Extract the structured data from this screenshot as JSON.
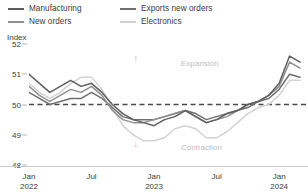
{
  "chart_data": {
    "type": "line",
    "title": "",
    "subtitle": "",
    "xlabel": "",
    "ylabel": "Index",
    "ylim": [
      48,
      52
    ],
    "yticks": [
      48,
      49,
      50,
      51,
      52
    ],
    "grid": false,
    "legend_position": "top-left",
    "reference_line": {
      "value": 50,
      "style": "dashed",
      "color": "#4a4a4a"
    },
    "annotations": [
      {
        "text": "Expansion",
        "icon": "arrow-up-icon",
        "position": "above-reference-line",
        "color": "#bdbdbd"
      },
      {
        "text": "Contraction",
        "icon": "arrow-down-icon",
        "position": "below-reference-line",
        "color": "#bdbdbd"
      }
    ],
    "x_tick_labels": [
      {
        "line1": "Jan",
        "line2": "2022"
      },
      {
        "line1": "Jul",
        "line2": ""
      },
      {
        "line1": "Jan",
        "line2": "2023"
      },
      {
        "line1": "Jul",
        "line2": ""
      },
      {
        "line1": "Jan",
        "line2": "2024"
      }
    ],
    "x": [
      "Jan 2022",
      "Feb 2022",
      "Mar 2022",
      "Apr 2022",
      "May 2022",
      "Jun 2022",
      "Jul 2022",
      "Aug 2022",
      "Sep 2022",
      "Oct 2022",
      "Nov 2022",
      "Dec 2022",
      "Jan 2023",
      "Feb 2023",
      "Mar 2023",
      "Apr 2023",
      "May 2023",
      "Jun 2023",
      "Jul 2023",
      "Aug 2023",
      "Sep 2023",
      "Oct 2023",
      "Nov 2023",
      "Dec 2023",
      "Jan 2024",
      "Feb 2024",
      "Mar 2024"
    ],
    "series": [
      {
        "name": "Manufacturing",
        "color": "#5e5e5e",
        "values": [
          51.0,
          50.7,
          50.4,
          50.6,
          50.8,
          50.6,
          50.7,
          50.4,
          50.0,
          49.7,
          49.5,
          49.4,
          49.3,
          49.5,
          49.6,
          49.8,
          49.6,
          49.4,
          49.5,
          49.7,
          49.8,
          50.0,
          50.1,
          50.3,
          50.7,
          51.6,
          51.4
        ]
      },
      {
        "name": "New orders",
        "color": "#8f8f8f",
        "values": [
          50.6,
          50.3,
          50.1,
          50.3,
          50.5,
          50.4,
          50.6,
          50.3,
          49.8,
          49.5,
          49.4,
          49.4,
          49.5,
          49.6,
          49.7,
          49.8,
          49.6,
          49.4,
          49.5,
          49.6,
          49.8,
          50.0,
          50.1,
          50.3,
          50.6,
          51.4,
          51.2
        ]
      },
      {
        "name": "Exports new orders",
        "color": "#6f6f6f",
        "values": [
          50.4,
          50.2,
          50.0,
          50.1,
          50.2,
          50.2,
          50.4,
          50.2,
          49.9,
          49.6,
          49.5,
          49.5,
          49.5,
          49.6,
          49.7,
          49.8,
          49.7,
          49.5,
          49.6,
          49.7,
          49.8,
          49.9,
          50.1,
          50.2,
          50.5,
          51.0,
          50.9
        ]
      },
      {
        "name": "Electronics",
        "color": "#d2d2d2",
        "values": [
          50.7,
          50.4,
          50.2,
          50.4,
          50.7,
          50.9,
          50.9,
          50.5,
          49.9,
          49.3,
          49.0,
          48.8,
          48.8,
          48.9,
          49.2,
          49.3,
          49.2,
          48.9,
          48.9,
          49.1,
          49.4,
          49.7,
          49.9,
          50.0,
          50.3,
          50.8,
          50.8
        ]
      }
    ]
  },
  "legend": {
    "items": [
      {
        "label": "Manufacturing",
        "color": "#5e5e5e"
      },
      {
        "label": "Exports new orders",
        "color": "#6f6f6f"
      },
      {
        "label": "New orders",
        "color": "#8f8f8f"
      },
      {
        "label": "Electronics",
        "color": "#d2d2d2"
      }
    ]
  },
  "axis": {
    "y_title": "Index",
    "y_ticks": [
      "52",
      "51",
      "50",
      "49",
      "48"
    ]
  },
  "notes": {
    "expansion": "Expansion",
    "contraction": "Contraction",
    "arrow_up": "↑",
    "arrow_down": "↓"
  }
}
